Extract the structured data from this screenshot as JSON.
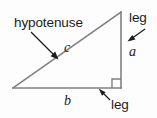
{
  "figure": {
    "type": "right-triangle-diagram",
    "background_color": "#fdfdfd",
    "stroke_color": "#808080",
    "text_color": "#1b1b1b",
    "labels": {
      "hypotenuse": "hypotenuse",
      "hypotenuse_var": "c",
      "leg_vertical": "leg",
      "leg_vertical_var": "a",
      "leg_horizontal": "leg",
      "leg_horizontal_var": "b"
    },
    "geometry": {
      "vertex_left": [
        13,
        88
      ],
      "vertex_apex": [
        121,
        12
      ],
      "vertex_right_angle": [
        121,
        88
      ],
      "right_angle_marker_size": 9
    },
    "pointers": [
      {
        "name": "hypotenuse-pointer",
        "from": [
          31,
          32
        ],
        "to": [
          58,
          59
        ]
      },
      {
        "name": "leg-a-pointer",
        "from": [
          145,
          29
        ],
        "to": [
          128,
          41
        ]
      },
      {
        "name": "leg-b-pointer",
        "from": [
          110,
          100
        ],
        "to": [
          99,
          89
        ]
      }
    ]
  }
}
